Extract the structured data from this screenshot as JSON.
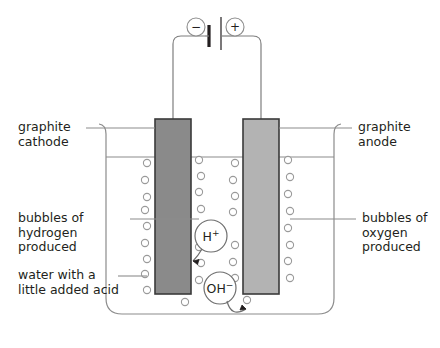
{
  "diagram": {
    "labels": {
      "cathode": "graphite\ncathode",
      "anode": "graphite\nanode",
      "hydrogen_bubbles": "bubbles of\nhydrogen\nproduced",
      "oxygen_bubbles": "bubbles of\noxygen\nproduced",
      "electrolyte": "water with a\nlittle added acid"
    },
    "ions": {
      "cation": "H",
      "cation_charge": "+",
      "anion": "OH",
      "anion_charge": "−"
    },
    "cell": {
      "negative_terminal": "−",
      "positive_terminal": "+"
    },
    "colors": {
      "cathode_fill": "#8a8a8a",
      "anode_fill": "#b3b3b3",
      "electrode_stroke": "#3a3a3a",
      "outline": "#8c8c8c",
      "text": "#231f20",
      "bubble_stroke": "#9a9a9a",
      "background": "#ffffff"
    }
  }
}
